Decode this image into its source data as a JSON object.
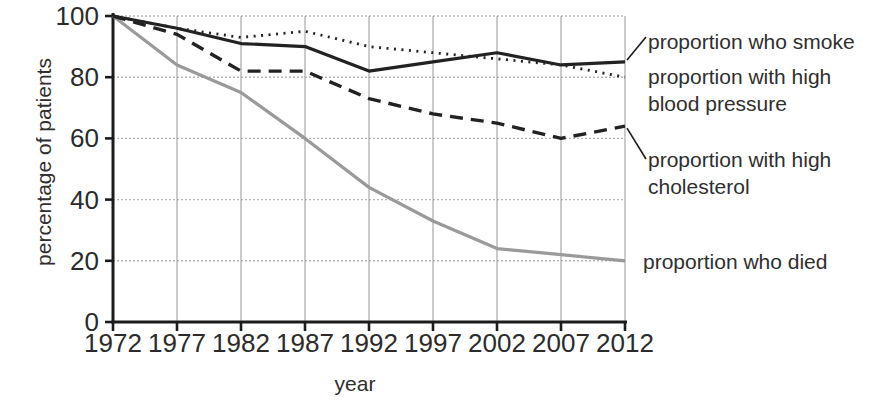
{
  "chart_data": {
    "type": "line",
    "title": "",
    "xlabel": "year",
    "ylabel": "percentage of patients",
    "x": [
      1972,
      1977,
      1982,
      1987,
      1992,
      1997,
      2002,
      2007,
      2012
    ],
    "ylim": [
      0,
      100
    ],
    "yticks": [
      0,
      20,
      40,
      60,
      80,
      100
    ],
    "grid": true,
    "legend_position": "right-annotations",
    "series": [
      {
        "name": "proportion who smoke",
        "style": "solid",
        "color": "#222222",
        "values": [
          100,
          96,
          91,
          90,
          82,
          85,
          88,
          84,
          85
        ]
      },
      {
        "name": "proportion with high blood pressure",
        "style": "dotted",
        "color": "#222222",
        "values": [
          100,
          96,
          93,
          95,
          90,
          88,
          86,
          84,
          80
        ]
      },
      {
        "name": "proportion with high cholesterol",
        "style": "dashed",
        "color": "#222222",
        "values": [
          100,
          94,
          82,
          82,
          73,
          68,
          65,
          60,
          64
        ]
      },
      {
        "name": "proportion who died",
        "style": "solid",
        "color": "#9a9a9a",
        "values": [
          100,
          84,
          75,
          60,
          44,
          33,
          24,
          22,
          20
        ]
      }
    ],
    "colors": {
      "axis": "#1c1c1c",
      "grid_vertical": "#a8a8a8",
      "grid_horizontal": "#b5b5b5",
      "text": "#2f2f2f",
      "background": "#ffffff"
    }
  }
}
